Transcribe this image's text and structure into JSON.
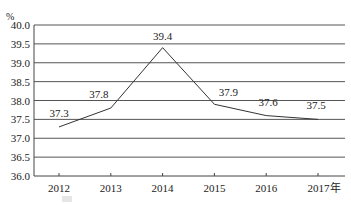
{
  "chart_data": {
    "type": "line",
    "title": "",
    "xlabel": "",
    "ylabel": "%",
    "categories": [
      "2012",
      "2013",
      "2014",
      "2015",
      "2016",
      "2017年"
    ],
    "series": [
      {
        "name": "",
        "values": [
          37.3,
          37.8,
          39.4,
          37.9,
          37.6,
          37.5
        ]
      }
    ],
    "data_labels": [
      "37.3",
      "37.8",
      "39.4",
      "37.9",
      "37.6",
      "37.5"
    ],
    "ylim": [
      36.0,
      40.0
    ],
    "yticks": [
      "36.0",
      "36.5",
      "37.0",
      "37.5",
      "38.0",
      "38.5",
      "39.0",
      "39.5",
      "40.0"
    ],
    "ytick_values": [
      36.0,
      36.5,
      37.0,
      37.5,
      38.0,
      38.5,
      39.0,
      39.5,
      40.0
    ],
    "grid": true,
    "legend": "none",
    "colors": {
      "line": "#333333",
      "grid": "#555555",
      "axis": "#444444"
    }
  }
}
